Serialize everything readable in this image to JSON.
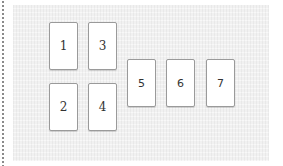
{
  "board": {
    "cards": [
      {
        "label": "1"
      },
      {
        "label": "2"
      },
      {
        "label": "3"
      },
      {
        "label": "4"
      },
      {
        "label": "5"
      },
      {
        "label": "6"
      },
      {
        "label": "7"
      }
    ]
  }
}
